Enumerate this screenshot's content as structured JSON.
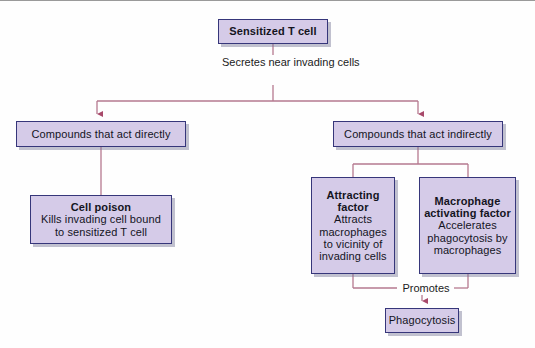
{
  "figure": {
    "name": "sensitized-t-cell-flowchart",
    "background": "#fefefe",
    "box_fill": "#d5cbe8",
    "box_border": "#36367a",
    "connector_color": "#b5798f"
  },
  "nodes": {
    "root": {
      "title": "Sensitized T cell",
      "desc": ""
    },
    "direct": {
      "title": "Compounds that act directly",
      "desc": ""
    },
    "indirect": {
      "title": "Compounds that act indirectly",
      "desc": ""
    },
    "cell_poison": {
      "title": "Cell poison",
      "desc": "Kills invading cell bound to sensitized T cell"
    },
    "attracting_factor": {
      "title": "Attracting factor",
      "desc": "Attracts macrophages to vicinity of invading cells"
    },
    "macrophage_activating_factor": {
      "title": "Macrophage activating factor",
      "desc": "Accelerates phagocytosis by macrophages"
    },
    "phagocytosis": {
      "title": "Phagocytosis",
      "desc": ""
    }
  },
  "edge_labels": {
    "secretes": "Secretes near invading cells",
    "promotes": "Promotes"
  }
}
